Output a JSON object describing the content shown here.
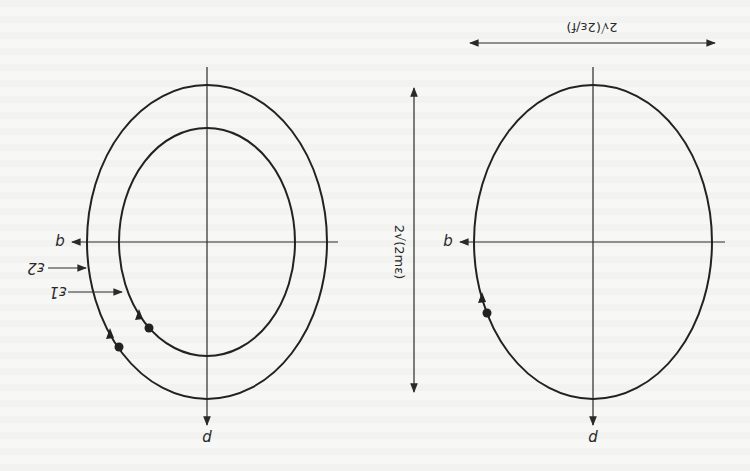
{
  "figure": {
    "orientation": "rotated 180 degrees (scanned page upside down)",
    "left_panel": {
      "axis_labels": {
        "horizontal": "q",
        "vertical": "p"
      },
      "curves": [
        {
          "name": "outer-ellipse",
          "energy_label": "ε2",
          "cx": 207,
          "cy": 242,
          "rx": 120,
          "ry": 157
        },
        {
          "name": "inner-ellipse",
          "energy_label": "ε1",
          "cx": 207,
          "cy": 242,
          "rx": 88,
          "ry": 114
        }
      ],
      "labels": {
        "eps2": "ε2",
        "eps1": "ε1",
        "q": "q",
        "p": "p"
      }
    },
    "right_panel": {
      "axis_labels": {
        "horizontal": "q",
        "vertical": "p"
      },
      "curve": {
        "name": "ellipse",
        "cx": 593,
        "cy": 242,
        "rx": 119,
        "ry": 157
      },
      "labels": {
        "q": "q",
        "p": "p"
      }
    },
    "dimensions": {
      "vertical": "2√(2mε)",
      "horizontal": "2√(2ε/f)"
    }
  }
}
